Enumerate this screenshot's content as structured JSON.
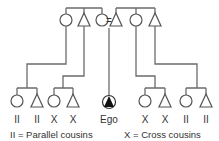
{
  "diagram": {
    "title": "",
    "marriage_sign": "=",
    "parents_generation": {
      "left_siblings": [
        {
          "sex": "female",
          "symbol": "circle"
        },
        {
          "sex": "male",
          "symbol": "triangle"
        },
        {
          "sex": "female",
          "symbol": "circle",
          "role": "ego-mother"
        }
      ],
      "right_siblings": [
        {
          "sex": "male",
          "symbol": "triangle",
          "role": "ego-father"
        },
        {
          "sex": "female",
          "symbol": "circle"
        },
        {
          "sex": "male",
          "symbol": "triangle"
        }
      ]
    },
    "cousins": [
      {
        "symbol": "circle",
        "mark": "II",
        "parent": "mother's sister"
      },
      {
        "symbol": "triangle",
        "mark": "II",
        "parent": "mother's sister"
      },
      {
        "symbol": "circle",
        "mark": "X",
        "parent": "mother's brother"
      },
      {
        "symbol": "triangle",
        "mark": "X",
        "parent": "mother's brother"
      },
      {
        "symbol": "circle",
        "mark": "X",
        "parent": "father's sister"
      },
      {
        "symbol": "triangle",
        "mark": "X",
        "parent": "father's sister"
      },
      {
        "symbol": "circle",
        "mark": "II",
        "parent": "father's brother"
      },
      {
        "symbol": "triangle",
        "mark": "II",
        "parent": "father's brother"
      }
    ],
    "ego": {
      "label": "Ego",
      "symbol": "filled-triangle-in-circle"
    },
    "legend": {
      "parallel": "II = Parallel cousins",
      "cross": "X = Cross cousins"
    }
  }
}
